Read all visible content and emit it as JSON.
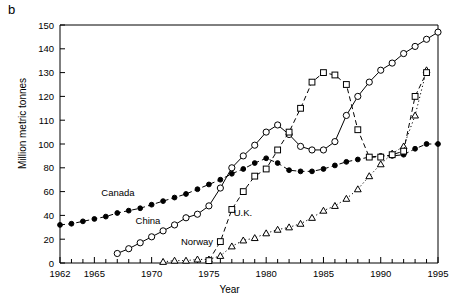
{
  "panel": {
    "label": "b"
  },
  "axes": {
    "ylabel": "Million metric tonnes",
    "xlabel": "Year",
    "y_ticks": [
      "0",
      "20",
      "40",
      "60",
      "80",
      "100",
      "110",
      "120",
      "130",
      "140",
      "150"
    ],
    "x_ticks": [
      "1962",
      "1965",
      "1970",
      "1975",
      "1980",
      "1985",
      "1990",
      "1995"
    ]
  },
  "series_labels": {
    "canada": "Canada",
    "china": "China",
    "norway": "Norway",
    "uk": "U.K."
  },
  "chart_data": {
    "type": "line",
    "title": "",
    "xlabel": "Year",
    "ylabel": "Million metric tonnes",
    "xlim": [
      1962,
      1995
    ],
    "ylim": [
      0,
      150
    ],
    "y_axis_note": "compressed below 100; minor ticks every 10 above 100, every 20 below",
    "grid": false,
    "legend": "inline annotations next to each curve",
    "series": [
      {
        "name": "Canada",
        "marker": "filled-circle",
        "linestyle": "dashed",
        "x": [
          1962,
          1963,
          1964,
          1965,
          1966,
          1967,
          1968,
          1969,
          1970,
          1971,
          1972,
          1973,
          1974,
          1975,
          1976,
          1977,
          1978,
          1979,
          1980,
          1981,
          1982,
          1983,
          1984,
          1985,
          1986,
          1987,
          1988,
          1989,
          1990,
          1991,
          1992,
          1993,
          1994,
          1995
        ],
        "y": [
          32,
          33,
          35,
          37,
          39,
          42,
          44,
          46,
          49,
          52,
          55,
          58,
          62,
          66,
          70,
          75,
          79,
          84,
          88,
          84,
          78,
          77,
          77,
          79,
          82,
          85,
          87,
          89,
          90,
          90,
          91,
          96,
          100,
          100
        ]
      },
      {
        "name": "China",
        "marker": "open-circle",
        "linestyle": "solid",
        "x": [
          1967,
          1968,
          1969,
          1970,
          1971,
          1972,
          1973,
          1974,
          1975,
          1976,
          1977,
          1978,
          1979,
          1980,
          1981,
          1982,
          1983,
          1984,
          1985,
          1986,
          1987,
          1988,
          1989,
          1990,
          1991,
          1992,
          1993,
          1994,
          1995
        ],
        "y": [
          8,
          12,
          17,
          22,
          27,
          32,
          38,
          41,
          48,
          63,
          80,
          90,
          99,
          105,
          108,
          104,
          98,
          95,
          95,
          101,
          112,
          120,
          126,
          131,
          134,
          138,
          141,
          144,
          147
        ]
      },
      {
        "name": "Norway",
        "marker": "open-triangle",
        "linestyle": "dotted",
        "x": [
          1971,
          1972,
          1973,
          1974,
          1975,
          1976,
          1977,
          1978,
          1979,
          1980,
          1981,
          1982,
          1983,
          1984,
          1985,
          1986,
          1987,
          1988,
          1989,
          1990,
          1991,
          1992,
          1993,
          1994
        ],
        "y": [
          1,
          2,
          2,
          3,
          3,
          6,
          14,
          19,
          21,
          25,
          28,
          30,
          33,
          38,
          44,
          48,
          54,
          62,
          73,
          83,
          92,
          98,
          112,
          131
        ]
      },
      {
        "name": "U.K.",
        "marker": "open-square",
        "linestyle": "dashed",
        "x": [
          1975,
          1976,
          1977,
          1978,
          1979,
          1980,
          1981,
          1982,
          1983,
          1984,
          1985,
          1986,
          1987,
          1988,
          1989,
          1990,
          1991,
          1992,
          1993,
          1994
        ],
        "y": [
          2,
          18,
          45,
          60,
          73,
          79,
          95,
          105,
          115,
          126,
          130,
          129,
          125,
          106,
          89,
          89,
          91,
          94,
          120,
          130
        ]
      }
    ]
  }
}
